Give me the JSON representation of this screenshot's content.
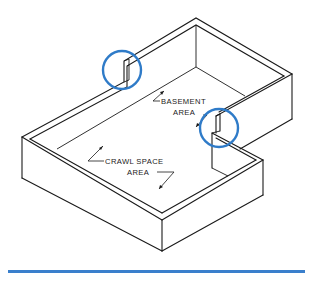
{
  "diagram": {
    "labels": {
      "basement_line1": "BASEMENT",
      "basement_line2": "AREA",
      "crawl_line1": "CRAWL SPACE",
      "crawl_line2": "AREA"
    },
    "highlights": [
      {
        "name": "upper-wall-step",
        "cx": 122,
        "cy": 70,
        "r": 19
      },
      {
        "name": "inner-corner-step",
        "cx": 219,
        "cy": 128,
        "r": 19
      }
    ],
    "colors": {
      "line": "#1a1a1a",
      "highlight": "#2f7bc8",
      "rule": "#3a7fcc",
      "background": "#ffffff"
    }
  }
}
